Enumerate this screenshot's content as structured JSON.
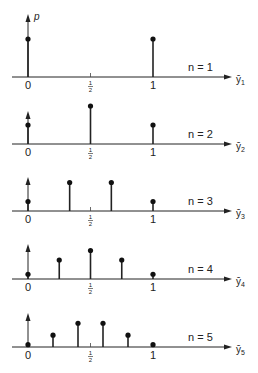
{
  "chart_data": {
    "type": "stem",
    "y_axis_label": "p",
    "panels": [
      {
        "n": 1,
        "label": "n = 1",
        "x_label": "ȳ",
        "x_sub": "1",
        "x": [
          0,
          1
        ],
        "p": [
          0.5,
          0.5
        ]
      },
      {
        "n": 2,
        "label": "n = 2",
        "x_label": "ȳ",
        "x_sub": "2",
        "x": [
          0,
          0.5,
          1
        ],
        "p": [
          0.25,
          0.5,
          0.25
        ]
      },
      {
        "n": 3,
        "label": "n = 3",
        "x_label": "ȳ",
        "x_sub": "3",
        "x": [
          0,
          0.3333,
          0.6667,
          1
        ],
        "p": [
          0.125,
          0.375,
          0.375,
          0.125
        ]
      },
      {
        "n": 4,
        "label": "n = 4",
        "x_label": "ȳ",
        "x_sub": "4",
        "x": [
          0,
          0.25,
          0.5,
          0.75,
          1
        ],
        "p": [
          0.0625,
          0.25,
          0.375,
          0.25,
          0.0625
        ]
      },
      {
        "n": 5,
        "label": "n = 5",
        "x_label": "ȳ",
        "x_sub": "5",
        "x": [
          0,
          0.2,
          0.4,
          0.6,
          0.8,
          1
        ],
        "p": [
          0.03125,
          0.15625,
          0.3125,
          0.3125,
          0.15625,
          0.03125
        ]
      }
    ],
    "x_ticks": [
      {
        "value": 0,
        "label": "0"
      },
      {
        "value": 0.5,
        "label_num": "1",
        "label_den": "2"
      },
      {
        "value": 1,
        "label": "1"
      }
    ],
    "xlim": [
      0,
      1
    ],
    "grid": false
  }
}
